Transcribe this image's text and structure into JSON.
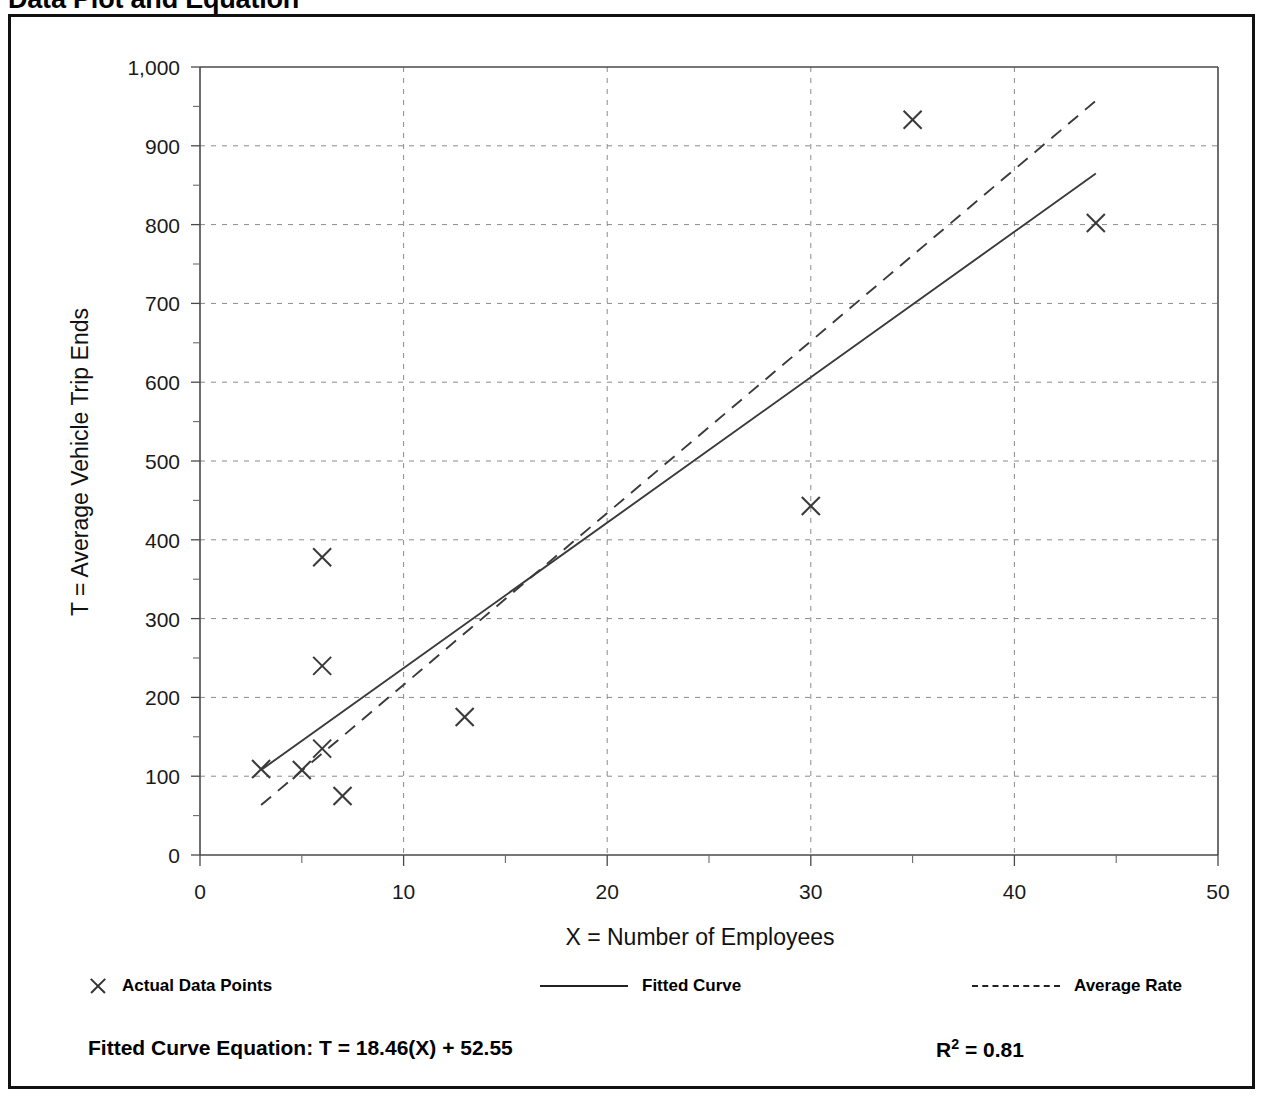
{
  "title": "Data Plot and Equation",
  "chart_data": {
    "type": "scatter",
    "title": "Data Plot and Equation",
    "xlabel": "X = Number of Employees",
    "ylabel": "T = Average Vehicle Trip Ends",
    "xlim": [
      0,
      50
    ],
    "ylim": [
      0,
      1000
    ],
    "x_ticks": [
      0,
      10,
      20,
      30,
      40,
      50
    ],
    "x_tick_labels": [
      "0",
      "10",
      "20",
      "30",
      "40",
      "50"
    ],
    "y_ticks": [
      0,
      100,
      200,
      300,
      400,
      500,
      600,
      700,
      800,
      900,
      1000
    ],
    "y_tick_labels": [
      "0",
      "100",
      "200",
      "300",
      "400",
      "500",
      "600",
      "700",
      "800",
      "900",
      "1,000"
    ],
    "y_minor_tick_step": 50,
    "grid": true,
    "grid_style": "dotted",
    "legend_position": "below-axis",
    "series": [
      {
        "name": "Actual Data Points",
        "type": "scatter",
        "marker": "x",
        "points": [
          {
            "x": 3,
            "y": 109
          },
          {
            "x": 5,
            "y": 108
          },
          {
            "x": 6,
            "y": 135
          },
          {
            "x": 6,
            "y": 240
          },
          {
            "x": 6,
            "y": 378
          },
          {
            "x": 7,
            "y": 75
          },
          {
            "x": 13,
            "y": 175
          },
          {
            "x": 30,
            "y": 443
          },
          {
            "x": 35,
            "y": 933
          },
          {
            "x": 44,
            "y": 802
          }
        ]
      },
      {
        "name": "Fitted Curve",
        "type": "line",
        "style": "solid",
        "equation": "T = 18.46(X) + 52.55",
        "slope": 18.46,
        "intercept": 52.55,
        "x_range": [
          3,
          44
        ]
      },
      {
        "name": "Average Rate",
        "type": "line",
        "style": "dashed",
        "slope": 21.8,
        "intercept": -2,
        "x_range": [
          3,
          44
        ]
      }
    ],
    "annotations": {
      "fitted_equation_label": "Fitted Curve Equation:  T = 18.46(X) + 52.55",
      "r_squared_label_prefix": "R",
      "r_squared_label_exponent": "2",
      "r_squared_label_value": " = 0.81",
      "r_squared": 0.81
    }
  },
  "legend": {
    "items": [
      {
        "label": "Actual Data Points",
        "sample": "x-marker"
      },
      {
        "label": "Fitted Curve",
        "sample": "solid-line"
      },
      {
        "label": "Average Rate",
        "sample": "dashed-line"
      }
    ]
  },
  "equation": {
    "fitted_curve": "Fitted Curve Equation:  T = 18.46(X) + 52.55",
    "r_prefix": "R",
    "r_exponent": "2",
    "r_value": " = 0.81"
  },
  "colors": {
    "ink": "#111111",
    "axis": "#4a4a4a",
    "grid": "#8a8a8a",
    "marker": "#3a3a3a",
    "background": "#ffffff"
  }
}
